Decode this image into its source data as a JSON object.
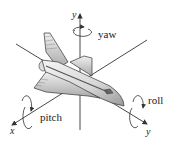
{
  "diagram": {
    "axes": {
      "vertical": "y",
      "left": "x",
      "right": "y"
    },
    "rotations": {
      "yaw": "yaw",
      "pitch": "pitch",
      "roll": "roll"
    },
    "colors": {
      "line": "#333333",
      "body_light": "#f2f2f2",
      "body_mid": "#c8c8c8",
      "body_dark": "#8a8a8a"
    }
  }
}
